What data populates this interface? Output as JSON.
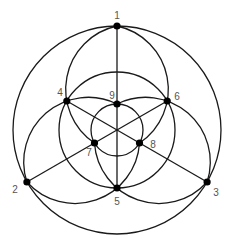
{
  "chart_data": {
    "type": "diagram",
    "title": "",
    "center": [
      117,
      130
    ],
    "points": [
      {
        "id": "1",
        "x": 117.0,
        "y": 26.0,
        "label_x": 117,
        "label_y": 16
      },
      {
        "id": "2",
        "x": 26.9,
        "y": 182.0,
        "label_x": 15,
        "label_y": 190
      },
      {
        "id": "3",
        "x": 207.1,
        "y": 182.0,
        "label_x": 216,
        "label_y": 193
      },
      {
        "id": "4",
        "x": 66.8,
        "y": 101.0,
        "label_x": 60,
        "label_y": 93
      },
      {
        "id": "5",
        "x": 117.0,
        "y": 188.0,
        "label_x": 117,
        "label_y": 202
      },
      {
        "id": "6",
        "x": 167.2,
        "y": 101.0,
        "label_x": 177,
        "label_y": 97
      },
      {
        "id": "7",
        "x": 94.5,
        "y": 143.0,
        "label_x": 89,
        "label_y": 153
      },
      {
        "id": "8",
        "x": 139.5,
        "y": 143.0,
        "label_x": 153,
        "label_y": 145
      },
      {
        "id": "9",
        "x": 117.0,
        "y": 104.0,
        "label_x": 112,
        "label_y": 96
      }
    ],
    "circles": [
      {
        "name": "outer-circle",
        "through": [
          "1",
          "2",
          "3"
        ],
        "cx": 117,
        "cy": 130,
        "r": 104
      },
      {
        "name": "middle-circle",
        "through": [
          "4",
          "5",
          "6"
        ],
        "cx": 117,
        "cy": 130,
        "r": 58
      },
      {
        "name": "inner-circle",
        "through": [
          "7",
          "8",
          "9"
        ],
        "cx": 117,
        "cy": 130,
        "r": 26
      }
    ],
    "lines": [
      {
        "name": "line-1-9-5",
        "through": [
          "1",
          "9",
          "5"
        ]
      },
      {
        "name": "line-2-7-6",
        "through": [
          "2",
          "7",
          "6"
        ]
      },
      {
        "name": "line-3-8-4",
        "through": [
          "3",
          "8",
          "4"
        ]
      }
    ],
    "arcs": [
      {
        "name": "arc-1-4-7",
        "through": [
          "1",
          "4",
          "7"
        ]
      },
      {
        "name": "arc-1-6-8",
        "through": [
          "1",
          "6",
          "8"
        ]
      },
      {
        "name": "arc-2-4-9",
        "through": [
          "2",
          "4",
          "9"
        ]
      },
      {
        "name": "arc-2-5-8",
        "through": [
          "2",
          "5",
          "8"
        ]
      },
      {
        "name": "arc-3-6-9",
        "through": [
          "3",
          "6",
          "9"
        ]
      },
      {
        "name": "arc-3-5-7",
        "through": [
          "3",
          "5",
          "7"
        ]
      }
    ],
    "style": {
      "stroke_color": "#1a1a1a",
      "dot_color": "#000000",
      "label_color": "#555555",
      "background": "#ffffff",
      "dot_radius": 3.6
    }
  }
}
